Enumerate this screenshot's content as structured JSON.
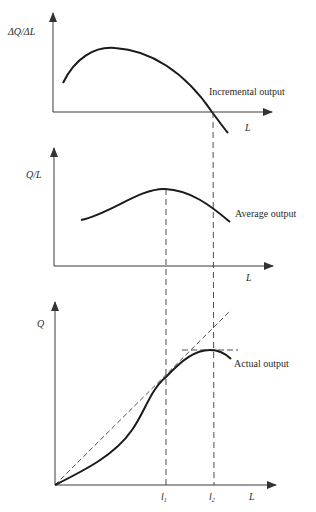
{
  "figure": {
    "type": "economics-production-diagram",
    "panels": [
      {
        "id": "incremental",
        "y_label": "ΔQ/ΔL",
        "x_label": "L",
        "curve_label": "Incremental output"
      },
      {
        "id": "average",
        "y_label": "Q/L",
        "x_label": "L",
        "curve_label": "Average output"
      },
      {
        "id": "actual",
        "y_label": "Q",
        "x_label": "L",
        "curve_label": "Actual output",
        "tick_labels": [
          "l",
          "l"
        ],
        "tick_subscripts": [
          "1",
          "2"
        ]
      }
    ]
  },
  "colors": {
    "line": "#1a1a1a",
    "axis": "#3a3a3a",
    "dash": "#3a3a3a",
    "text": "#2a2a2a"
  }
}
